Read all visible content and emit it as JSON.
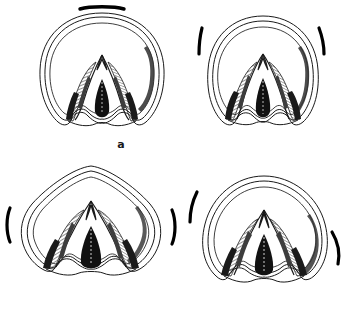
{
  "figure": {
    "title": "",
    "kind": "scientific-line-drawing",
    "background_color": "#ffffff",
    "ink_color": "#1a1a1a",
    "panel_count": 4
  },
  "panels": [
    {
      "id": "a",
      "label": "a",
      "outline_shape": "broad rounded, nearly circular dome",
      "tick_marks": [
        {
          "position": "top-centre",
          "orientation": "horizontal",
          "style": "thick-bar"
        }
      ],
      "tick_count": 1
    },
    {
      "id": "b",
      "label": "b",
      "outline_shape": "tall ovate dome, slightly narrowed apex",
      "tick_marks": [
        {
          "position": "upper-left",
          "orientation": "oblique",
          "style": "thick-bar"
        },
        {
          "position": "upper-right",
          "orientation": "oblique",
          "style": "thick-bar"
        }
      ],
      "tick_count": 2
    },
    {
      "id": "c",
      "label": "c",
      "outline_shape": "broad sub-triangular / rounded-rhomboid",
      "tick_marks": [
        {
          "position": "mid-left",
          "orientation": "vertical-curved",
          "style": "thick-arc"
        },
        {
          "position": "mid-right",
          "orientation": "vertical-curved",
          "style": "thick-arc"
        }
      ],
      "tick_count": 2
    },
    {
      "id": "d",
      "label": "d",
      "outline_shape": "rounded dome, flattened right flank",
      "tick_marks": [
        {
          "position": "upper-left",
          "orientation": "oblique-curved",
          "style": "thick-arc"
        },
        {
          "position": "lower-right",
          "orientation": "oblique-curved",
          "style": "thick-arc"
        }
      ],
      "tick_count": 2
    }
  ],
  "colors": {
    "ink": "#1a1a1a",
    "shade_dark": "#262626",
    "shade_mid": "#555555",
    "shade_light": "#9a9a9a",
    "paper": "#ffffff"
  }
}
